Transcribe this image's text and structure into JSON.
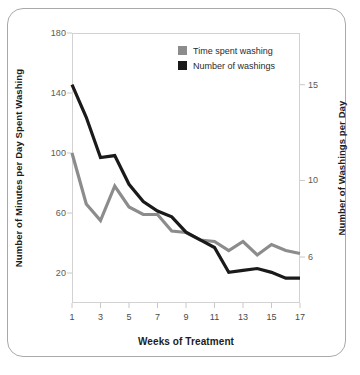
{
  "chart_data": {
    "type": "line",
    "title": "",
    "subtitle": "",
    "xlabel": "Weeks of Treatment",
    "ylabel": "Number of Minutes per Day Spent Washing",
    "ylabel_right": "Number of Washings per Day",
    "x": [
      1,
      2,
      3,
      4,
      5,
      6,
      7,
      8,
      9,
      10,
      11,
      12,
      13,
      14,
      15,
      16,
      17
    ],
    "xlim": [
      1,
      17
    ],
    "xticks": [
      1,
      3,
      5,
      7,
      9,
      11,
      13,
      15,
      17
    ],
    "xtick_labels": [
      "1",
      "3",
      "5",
      "7",
      "9",
      "11",
      "13",
      "15",
      "17"
    ],
    "ylim": [
      0,
      180
    ],
    "yticks": [
      20,
      60,
      100,
      140,
      180
    ],
    "ytick_labels": [
      "20",
      "60",
      "100",
      "140",
      "180"
    ],
    "ylim_right": [
      3.6,
      17.7
    ],
    "yticks_right": [
      6,
      10,
      15
    ],
    "ytick_labels_right": [
      "6",
      "10",
      "15"
    ],
    "grid": false,
    "legend_position": "top-center",
    "series": [
      {
        "name": "Time spent washing",
        "axis": "left",
        "color": "#8c8c8c",
        "values": [
          100,
          66,
          55,
          78,
          64,
          59,
          59,
          48,
          47,
          42,
          41,
          35,
          41,
          32,
          39,
          35,
          33
        ]
      },
      {
        "name": "Number of washings",
        "axis": "right",
        "color": "#1a1a1a",
        "values": [
          15.0,
          13.3,
          11.2,
          11.3,
          9.8,
          8.9,
          8.4,
          8.1,
          7.3,
          6.9,
          6.5,
          5.2,
          5.3,
          5.4,
          5.2,
          4.9,
          4.9
        ]
      }
    ]
  },
  "axes": {
    "left_title": "Number of Minutes per Day Spent Washing",
    "right_title": "Number of Washings per Day",
    "bottom_title": "Weeks of Treatment"
  },
  "legend": {
    "items": [
      {
        "label": "Time spent washing",
        "color": "#8c8c8c"
      },
      {
        "label": "Number of washings",
        "color": "#1a1a1a"
      }
    ]
  },
  "colors": {
    "series_gray": "#8c8c8c",
    "series_dark": "#1a1a1a",
    "frame_border": "#a9a9a9",
    "plot_border": "#d2d2d2",
    "tick_text": "#5a5a5a",
    "title_text": "#1c1c1c"
  }
}
